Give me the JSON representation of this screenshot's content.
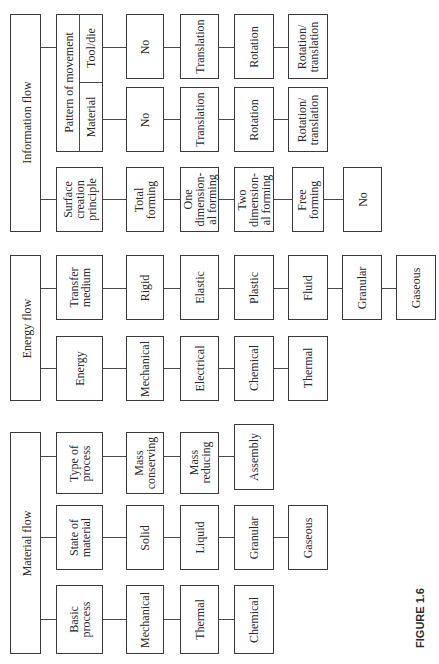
{
  "figure": {
    "caption": "FIGURE 1.6",
    "groups": [
      {
        "title": "Material flow",
        "categories": [
          {
            "label": "Basic process",
            "items": [
              "Mechanical",
              "Thermal",
              "Chemical"
            ]
          },
          {
            "label": "State of material",
            "items": [
              "Solid",
              "Liquid",
              "Granular",
              "Gaseous"
            ]
          },
          {
            "label": "Type of process",
            "items": [
              "Mass conserving",
              "Mass reducing",
              "Assembly"
            ]
          }
        ]
      },
      {
        "title": "Energy flow",
        "categories": [
          {
            "label": "Energy",
            "items": [
              "Mechanical",
              "Electrical",
              "Chemical",
              "Thermal"
            ]
          },
          {
            "label": "Transfer medium",
            "items": [
              "Rigid",
              "Elastic",
              "Plastic",
              "Fluid",
              "Granular",
              "Gaseous"
            ]
          }
        ]
      },
      {
        "title": "Information flow",
        "categories": [
          {
            "label": "Surface creation principle",
            "items": [
              "Total forming",
              "One dimension-al forming",
              "Two dimension-al forming",
              "Free forming",
              "No"
            ]
          },
          {
            "label": "Pattern of movement",
            "subcategories": [
              {
                "label": "Material",
                "items": [
                  "No",
                  "Translation",
                  "Rotation",
                  "Rotation/ translation"
                ]
              },
              {
                "label": "Tool/die",
                "items": [
                  "No",
                  "Translation",
                  "Rotation",
                  "Rotation/ translation"
                ]
              }
            ]
          }
        ]
      }
    ]
  },
  "labels": {
    "mf_title": "Material flow",
    "ef_title": "Energy flow",
    "if_title": "Information flow",
    "basic_process": "Basic\nprocess",
    "state_of_material": "State of\nmaterial",
    "type_of_process": "Type of\nprocess",
    "bp_1": "Mechanical",
    "bp_2": "Thermal",
    "bp_3": "Chemical",
    "sm_1": "Solid",
    "sm_2": "Liquid",
    "sm_3": "Granular",
    "sm_4": "Gaseous",
    "tp_1": "Mass\nconserving",
    "tp_2": "Mass\nreducing",
    "tp_3": "Assembly",
    "energy": "Energy",
    "transfer_medium": "Transfer\nmedium",
    "en_1": "Mechanical",
    "en_2": "Electrical",
    "en_3": "Chemical",
    "en_4": "Thermal",
    "tm_1": "Rigid",
    "tm_2": "Elastic",
    "tm_3": "Plastic",
    "tm_4": "Fluid",
    "tm_5": "Granular",
    "tm_6": "Gaseous",
    "surface_creation": "Surface\ncreation\nprinciple",
    "pattern_of_movement": "Pattern of movement",
    "material": "Material",
    "tool_die": "Tool/die",
    "sc_1": "Total\nforming",
    "sc_2": "One\ndimension-\nal forming",
    "sc_3": "Two\ndimension-\nal forming",
    "sc_4": "Free\nforming",
    "sc_5": "No",
    "ma_1": "No",
    "ma_2": "Translation",
    "ma_3": "Rotation",
    "ma_4": "Rotation/\ntranslation",
    "td_1": "No",
    "td_2": "Translation",
    "td_3": "Rotation",
    "td_4": "Rotation/\ntranslation",
    "caption": "FIGURE 1.6"
  }
}
